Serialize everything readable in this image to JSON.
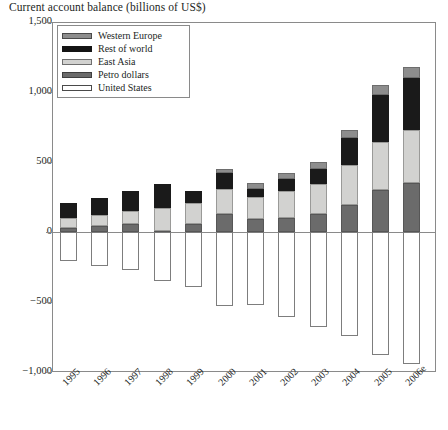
{
  "chart_data": {
    "type": "bar",
    "subtype": "stacked-bar-with-negatives",
    "title": "Current account balance (billions of US$)",
    "xlabel": "",
    "ylabel": "",
    "ylim": [
      -1000,
      1500
    ],
    "yticks": [
      "-1,000",
      "-500",
      "0",
      "500",
      "1,000",
      "1,500"
    ],
    "ytick_values": [
      -1000,
      -500,
      0,
      500,
      1000,
      1500
    ],
    "grid": false,
    "legend_position": "top-left-inside",
    "categories": [
      "1995",
      "1996",
      "1997",
      "1998",
      "1999",
      "2000",
      "2001",
      "2002",
      "2003",
      "2004",
      "2005",
      "2006e"
    ],
    "series": [
      {
        "name": "Petro dollars",
        "color": "#6b6b6b",
        "values": [
          30,
          40,
          55,
          10,
          60,
          130,
          90,
          100,
          130,
          190,
          300,
          350
        ]
      },
      {
        "name": "East Asia",
        "color": "#d2d2d0",
        "values": [
          70,
          80,
          95,
          160,
          150,
          180,
          160,
          190,
          210,
          290,
          340,
          380
        ]
      },
      {
        "name": "Rest of world",
        "color": "#1a1a1a",
        "values": [
          110,
          120,
          140,
          170,
          80,
          110,
          60,
          90,
          110,
          190,
          340,
          370
        ]
      },
      {
        "name": "Western Europe",
        "color": "#8d8d8d",
        "values": [
          0,
          0,
          0,
          0,
          0,
          30,
          40,
          40,
          50,
          60,
          70,
          80
        ]
      },
      {
        "name": "United States",
        "color": "#ffffff",
        "values": [
          -210,
          -240,
          -270,
          -350,
          -390,
          -530,
          -520,
          -610,
          -680,
          -740,
          -880,
          -940
        ]
      }
    ],
    "positive_totals": [
      210,
      240,
      290,
      340,
      290,
      450,
      350,
      420,
      500,
      730,
      1050,
      1180
    ]
  },
  "legend": {
    "items": [
      {
        "label": "Western Europe",
        "swatch": "swatch-western-europe"
      },
      {
        "label": "Rest of world",
        "swatch": "swatch-rest-of-world"
      },
      {
        "label": "East Asia",
        "swatch": "swatch-east-asia"
      },
      {
        "label": "Petro dollars",
        "swatch": "swatch-petro-dollars"
      },
      {
        "label": "United States",
        "swatch": "swatch-united-states"
      }
    ]
  }
}
